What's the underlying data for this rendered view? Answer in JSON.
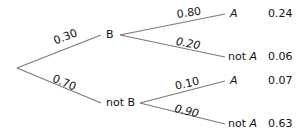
{
  "diagram": {
    "type": "probability-tree",
    "first_level": [
      {
        "event": "B",
        "probability": "0.30"
      },
      {
        "event": "not B",
        "probability": "0.70"
      }
    ],
    "second_level": [
      {
        "parent": "B",
        "outcome_prefix": "",
        "outcome": "A",
        "probability": "0.80",
        "joint": "0.24"
      },
      {
        "parent": "B",
        "outcome_prefix": "not",
        "outcome": "A",
        "probability": "0.20",
        "joint": "0.06"
      },
      {
        "parent": "not B",
        "outcome_prefix": "",
        "outcome": "A",
        "probability": "0.10",
        "joint": "0.07"
      },
      {
        "parent": "not B",
        "outcome_prefix": "not",
        "outcome": "A",
        "probability": "0.90",
        "joint": "0.63"
      }
    ],
    "line_color": "#7a7a7a"
  }
}
